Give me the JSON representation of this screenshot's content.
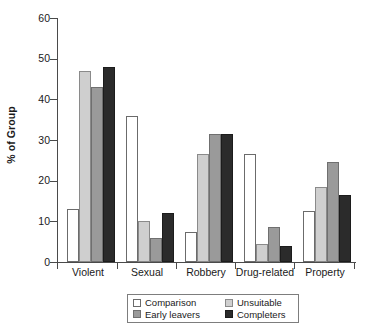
{
  "chart_data": {
    "type": "bar",
    "title": "",
    "xlabel": "",
    "ylabel": "% of Group",
    "ylim": [
      0,
      60
    ],
    "yticks": [
      0,
      10,
      20,
      30,
      40,
      50,
      60
    ],
    "grid": false,
    "legend_position": "bottom",
    "categories": [
      "Violent",
      "Sexual",
      "Robbery",
      "Drug-related",
      "Property"
    ],
    "series": [
      {
        "name": "Comparison",
        "color": "#ffffff",
        "values": [
          13,
          36,
          7.5,
          26.5,
          12.5
        ]
      },
      {
        "name": "Unsuitable",
        "color": "#cfcfcf",
        "values": [
          47,
          10,
          26.5,
          4.5,
          18.5
        ]
      },
      {
        "name": "Early leavers",
        "color": "#9a9a9a",
        "values": [
          43,
          6,
          31.5,
          8.5,
          24.5
        ]
      },
      {
        "name": "Completers",
        "color": "#2b2b2b",
        "values": [
          48,
          12,
          31.5,
          4,
          16.5
        ]
      }
    ]
  },
  "axis": {
    "y_title": "% of Group",
    "y_tick_labels": [
      "0",
      "10",
      "20",
      "30",
      "40",
      "50",
      "60"
    ],
    "x_tick_labels": [
      "Violent",
      "Sexual",
      "Robbery",
      "Drug-related",
      "Property"
    ]
  },
  "legend": {
    "items": [
      {
        "label": "Comparison",
        "swatch": "comparison"
      },
      {
        "label": "Unsuitable",
        "swatch": "unsuitable"
      },
      {
        "label": "Early leavers",
        "swatch": "early"
      },
      {
        "label": "Completers",
        "swatch": "completers"
      }
    ]
  }
}
